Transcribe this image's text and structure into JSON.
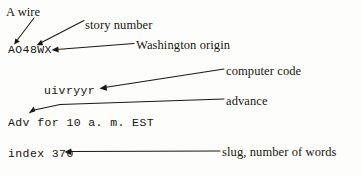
{
  "figure": {
    "type": "annotated-diagram",
    "ink_color": "#1a1812",
    "background_color": "#fdfdfb"
  },
  "codes": [
    {
      "id": "story-id",
      "text": "AO48WX",
      "x": 8,
      "y": 44
    },
    {
      "id": "computer-code",
      "text": "uivryyr",
      "x": 44,
      "y": 85
    },
    {
      "id": "advance-line",
      "text": "Adv for 10 a. m. EST",
      "x": 8,
      "y": 117
    },
    {
      "id": "slug-line",
      "text": "index 370",
      "x": 8,
      "y": 148
    }
  ],
  "labels": [
    {
      "id": "a-wire",
      "text": "A wire",
      "x": 6,
      "y": 6
    },
    {
      "id": "story-number",
      "text": "story number",
      "x": 85,
      "y": 19
    },
    {
      "id": "washington-origin",
      "text": "Washington origin",
      "x": 136,
      "y": 39
    },
    {
      "id": "computer-code",
      "text": "computer code",
      "x": 226,
      "y": 65
    },
    {
      "id": "advance",
      "text": "advance",
      "x": 226,
      "y": 95
    },
    {
      "id": "slug-number-of-words",
      "text": "slug, number of words",
      "x": 222,
      "y": 148
    }
  ],
  "leaders": [
    {
      "id": "leader-a-wire",
      "from_label": "A wire",
      "to_code": "AO48WX"
    },
    {
      "id": "leader-story-number",
      "from_label": "story number",
      "to_code": "AO48WX"
    },
    {
      "id": "leader-washington-origin",
      "from_label": "Washington origin",
      "to_code": "AO48WX"
    },
    {
      "id": "leader-computer-code",
      "from_label": "computer code",
      "to_code": "uivryyr"
    },
    {
      "id": "leader-advance",
      "from_label": "advance",
      "to_code": "Adv for 10 a. m. EST"
    },
    {
      "id": "leader-slug",
      "from_label": "slug, number of words",
      "to_code": "index 370"
    }
  ]
}
